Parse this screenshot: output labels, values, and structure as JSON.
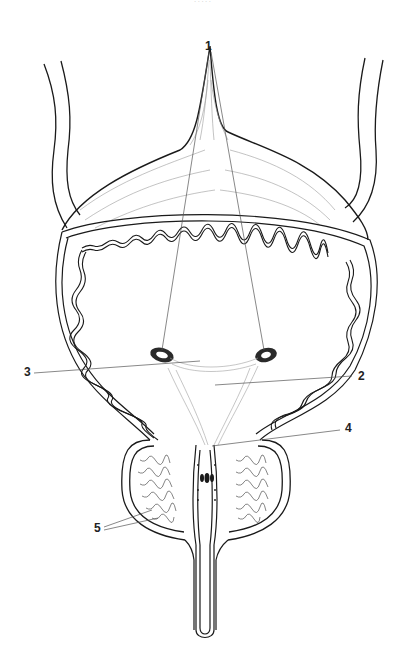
{
  "figure": {
    "top_caption_fragment": "·····",
    "colors": {
      "line": "#1a1a1a",
      "leader": "#555555",
      "hatch": "#9a9a9a",
      "background": "#ffffff"
    }
  },
  "labels": [
    {
      "id": "1",
      "text": "1",
      "x": 205,
      "y": 40
    },
    {
      "id": "2",
      "text": "2",
      "x": 358,
      "y": 374
    },
    {
      "id": "3",
      "text": "3",
      "x": 24,
      "y": 370
    },
    {
      "id": "4",
      "text": "4",
      "x": 345,
      "y": 426
    },
    {
      "id": "5",
      "text": "5",
      "x": 94,
      "y": 526
    }
  ]
}
